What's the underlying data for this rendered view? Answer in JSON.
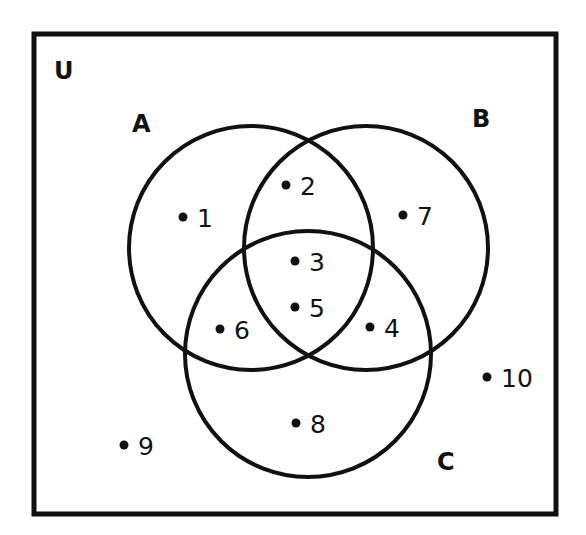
{
  "diagram": {
    "type": "venn-3-set",
    "stroke_color": "#111111",
    "background": "#ffffff",
    "universe": {
      "label": "U",
      "box": {
        "x": 34,
        "y": 34,
        "width": 522,
        "height": 480
      },
      "label_pos": {
        "x": 54,
        "y": 79
      }
    },
    "sets": [
      {
        "id": "A",
        "label": "A",
        "cx": 251,
        "cy": 248,
        "r": 122,
        "label_pos": {
          "x": 132,
          "y": 132
        }
      },
      {
        "id": "B",
        "label": "B",
        "cx": 366,
        "cy": 248,
        "r": 122,
        "label_pos": {
          "x": 472,
          "y": 127
        }
      },
      {
        "id": "C",
        "label": "C",
        "cx": 308,
        "cy": 354,
        "r": 123,
        "label_pos": {
          "x": 437,
          "y": 470
        }
      }
    ],
    "elements": [
      {
        "value": "1",
        "region": "A only",
        "dot": {
          "x": 183,
          "y": 217
        },
        "text": {
          "x": 197,
          "y": 227
        }
      },
      {
        "value": "2",
        "region": "A ∩ B only",
        "dot": {
          "x": 286,
          "y": 185
        },
        "text": {
          "x": 300,
          "y": 195
        }
      },
      {
        "value": "3",
        "region": "A ∩ B ∩ C",
        "dot": {
          "x": 295,
          "y": 261
        },
        "text": {
          "x": 309,
          "y": 271
        }
      },
      {
        "value": "4",
        "region": "B ∩ C only",
        "dot": {
          "x": 370,
          "y": 327
        },
        "text": {
          "x": 384,
          "y": 337
        }
      },
      {
        "value": "5",
        "region": "A ∩ B ∩ C",
        "dot": {
          "x": 295,
          "y": 307
        },
        "text": {
          "x": 309,
          "y": 317
        }
      },
      {
        "value": "6",
        "region": "A ∩ C only",
        "dot": {
          "x": 220,
          "y": 329
        },
        "text": {
          "x": 234,
          "y": 339
        }
      },
      {
        "value": "7",
        "region": "B only",
        "dot": {
          "x": 403,
          "y": 215
        },
        "text": {
          "x": 417,
          "y": 225
        }
      },
      {
        "value": "8",
        "region": "C only",
        "dot": {
          "x": 296,
          "y": 423
        },
        "text": {
          "x": 310,
          "y": 433
        }
      },
      {
        "value": "9",
        "region": "outside",
        "dot": {
          "x": 124,
          "y": 445
        },
        "text": {
          "x": 138,
          "y": 455
        }
      },
      {
        "value": "10",
        "region": "outside",
        "dot": {
          "x": 487,
          "y": 377
        },
        "text": {
          "x": 501,
          "y": 387
        }
      }
    ]
  }
}
